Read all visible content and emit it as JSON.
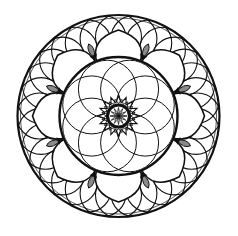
{
  "image": {
    "description": "Black and white circular mandala line art",
    "width": 238,
    "height": 236,
    "background": "#ffffff",
    "ink": "#111111",
    "accent_gray": "#8a8a8a"
  },
  "mandala": {
    "center": [
      118.5,
      116
    ],
    "outer_circle": {
      "r": 101,
      "stroke": 2.2
    },
    "lattice_band": {
      "count": 32,
      "ring_r": 79,
      "circle_r": 23,
      "stroke": 1.1
    },
    "petal_ring": {
      "count": 8,
      "inner_r": 59,
      "outer_r": 86,
      "stroke": 1.6,
      "accent_count": 8
    },
    "inner_boundary": {
      "r": 59,
      "stroke": 2.4
    },
    "rosette": {
      "count": 8,
      "offset": 29,
      "circle_r": 29,
      "stroke": 1.0
    },
    "star": {
      "points": 16,
      "outer_r": 20,
      "inner_r": 13.5,
      "stroke": 1.1
    },
    "center_ring": {
      "r": 11,
      "stroke": 3.2
    },
    "flower": {
      "petals": 12,
      "r": 8.5
    }
  }
}
